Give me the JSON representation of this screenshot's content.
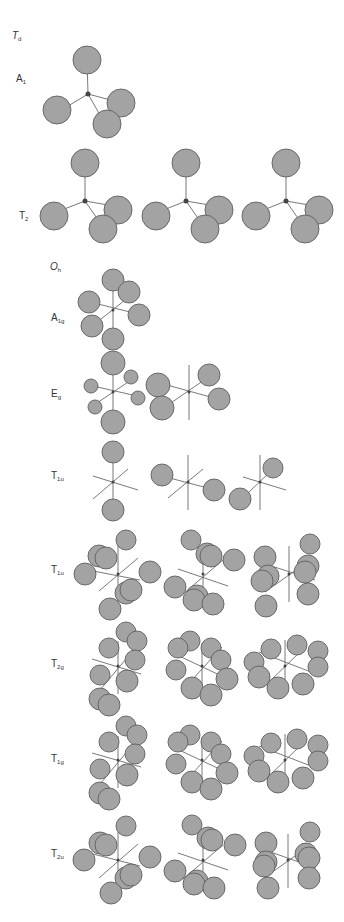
{
  "colors": {
    "lobe_fill": "#a3a3a3",
    "lobe_stroke": "#5f5f5f",
    "bond": "#6a6a6a",
    "center": "#444444",
    "text": "#333333"
  },
  "labels": [
    {
      "id": "group-td",
      "main": "T",
      "sub": "d",
      "italic": true,
      "x": 12,
      "y": 37
    },
    {
      "id": "irrep-a1",
      "main": "A",
      "sub": "1",
      "italic": false,
      "x": 16,
      "y": 80
    },
    {
      "id": "irrep-t2",
      "main": "T",
      "sub": "2",
      "italic": false,
      "x": 19,
      "y": 217
    },
    {
      "id": "group-oh",
      "main": "O",
      "sub": "h",
      "italic": true,
      "x": 50,
      "y": 268
    },
    {
      "id": "irrep-a1g",
      "main": "A",
      "sub": "1g",
      "italic": false,
      "x": 51,
      "y": 319
    },
    {
      "id": "irrep-eg",
      "main": "E",
      "sub": "g",
      "italic": false,
      "x": 51,
      "y": 395
    },
    {
      "id": "irrep-t1u-a",
      "main": "T",
      "sub": "1u",
      "italic": false,
      "x": 51,
      "y": 477
    },
    {
      "id": "irrep-t1u-b",
      "main": "T",
      "sub": "1u",
      "italic": false,
      "x": 51,
      "y": 571
    },
    {
      "id": "irrep-t2g",
      "main": "T",
      "sub": "2g",
      "italic": false,
      "x": 51,
      "y": 665
    },
    {
      "id": "irrep-t1g",
      "main": "T",
      "sub": "1g",
      "italic": false,
      "x": 51,
      "y": 760
    },
    {
      "id": "irrep-t2u",
      "main": "T",
      "sub": "2u",
      "italic": false,
      "x": 51,
      "y": 855
    }
  ],
  "diagrams": [
    {
      "id": "td-a1",
      "center": [
        88,
        94
      ],
      "lines": [
        [
          88,
          94,
          87,
          60
        ],
        [
          88,
          94,
          58,
          112
        ],
        [
          88,
          94,
          118,
          102
        ],
        [
          88,
          94,
          104,
          122
        ]
      ],
      "lobes": [
        [
          87,
          60,
          14
        ],
        [
          57,
          110,
          14
        ],
        [
          121,
          103,
          14
        ],
        [
          107,
          124,
          14
        ]
      ]
    },
    {
      "id": "td-t2-1",
      "center": [
        85,
        201
      ],
      "lines": [
        [
          85,
          201,
          85,
          167
        ],
        [
          85,
          201,
          54,
          213
        ],
        [
          85,
          201,
          114,
          206
        ],
        [
          85,
          201,
          101,
          224
        ]
      ],
      "lobes": [
        [
          85,
          163,
          14
        ],
        [
          54,
          216,
          14
        ],
        [
          118,
          210,
          14
        ],
        [
          103,
          229,
          14
        ]
      ]
    },
    {
      "id": "td-t2-2",
      "center": [
        186,
        201
      ],
      "lines": [
        [
          186,
          201,
          186,
          167
        ],
        [
          186,
          201,
          156,
          213
        ],
        [
          186,
          201,
          215,
          206
        ],
        [
          186,
          201,
          202,
          224
        ]
      ],
      "lobes": [
        [
          186,
          163,
          14
        ],
        [
          156,
          216,
          14
        ],
        [
          219,
          210,
          14
        ],
        [
          205,
          229,
          14
        ]
      ]
    },
    {
      "id": "td-t2-3",
      "center": [
        286,
        201
      ],
      "lines": [
        [
          286,
          201,
          286,
          167
        ],
        [
          286,
          201,
          256,
          213
        ],
        [
          286,
          201,
          315,
          206
        ],
        [
          286,
          201,
          302,
          224
        ]
      ],
      "lobes": [
        [
          286,
          163,
          14
        ],
        [
          256,
          216,
          14
        ],
        [
          319,
          210,
          14
        ],
        [
          305,
          229,
          14
        ]
      ]
    },
    {
      "id": "oh-a1g",
      "center": [
        113,
        310
      ],
      "lines": [
        [
          113,
          290,
          113,
          332
        ],
        [
          90,
          302,
          138,
          314
        ],
        [
          96,
          323,
          134,
          293
        ]
      ],
      "lobes": [
        [
          113,
          280,
          11
        ],
        [
          129,
          292,
          11
        ],
        [
          89,
          302,
          11
        ],
        [
          139,
          315,
          11
        ],
        [
          92,
          326,
          11
        ],
        [
          113,
          339,
          11
        ]
      ]
    },
    {
      "id": "oh-eg-1",
      "center": [
        113,
        392
      ],
      "lines": [
        [
          113,
          372,
          113,
          414
        ],
        [
          93,
          386,
          137,
          396
        ],
        [
          97,
          403,
          131,
          380
        ]
      ],
      "lobes": [
        [
          113,
          363,
          12
        ],
        [
          113,
          422,
          12
        ],
        [
          131,
          377,
          7
        ],
        [
          91,
          386,
          7
        ],
        [
          138,
          398,
          7
        ],
        [
          95,
          407,
          7
        ]
      ]
    },
    {
      "id": "oh-eg-2",
      "center": [
        189,
        392
      ],
      "lines": [
        [
          189,
          365,
          189,
          420
        ],
        [
          167,
          385,
          214,
          398
        ],
        [
          165,
          407,
          210,
          376
        ]
      ],
      "lobes": [
        [
          209,
          375,
          11
        ],
        [
          158,
          385,
          12
        ],
        [
          219,
          399,
          11
        ],
        [
          162,
          408,
          12
        ]
      ]
    },
    {
      "id": "oh-t1u-1",
      "center": [
        113,
        482
      ],
      "lines": [
        [
          113,
          452,
          113,
          512
        ],
        [
          93,
          476,
          138,
          490
        ],
        [
          93,
          499,
          128,
          469
        ]
      ],
      "lobes": [
        [
          113,
          452,
          11
        ],
        [
          113,
          510,
          11
        ]
      ]
    },
    {
      "id": "oh-t1u-2",
      "center": [
        188,
        482
      ],
      "lines": [
        [
          188,
          455,
          188,
          510
        ],
        [
          166,
          477,
          215,
          490
        ],
        [
          168,
          498,
          203,
          469
        ]
      ],
      "lobes": [
        [
          162,
          475,
          11
        ],
        [
          214,
          490,
          11
        ]
      ]
    },
    {
      "id": "oh-t1u-3",
      "center": [
        260,
        482
      ],
      "lines": [
        [
          260,
          455,
          260,
          510
        ],
        [
          243,
          477,
          286,
          490
        ],
        [
          248,
          493,
          273,
          469
        ]
      ],
      "lobes": [
        [
          273,
          468,
          10
        ],
        [
          240,
          499,
          11
        ]
      ]
    },
    {
      "id": "oh-t1u-pair-1",
      "center": [
        118,
        574
      ],
      "lines": [
        [
          118,
          545,
          118,
          603
        ],
        [
          93,
          571,
          140,
          580
        ],
        [
          99,
          591,
          138,
          558
        ]
      ],
      "pairs": [
        [
          [
            127,
            541,
            10
          ],
          [
            103,
            561,
            11
          ],
          [
            98,
            558,
            11
          ]
        ],
        [
          [
            89,
            575,
            11
          ],
          [
            106,
            573,
            0
          ]
        ],
        [
          [
            149,
            572,
            11
          ]
        ],
        [
          [
            131,
            591,
            11
          ],
          [
            125,
            594,
            11
          ]
        ],
        [
          [
            110,
            608,
            11
          ]
        ]
      ],
      "lobes": [
        [
          126,
          540,
          10
        ],
        [
          99,
          556,
          11
        ],
        [
          106,
          558,
          11
        ],
        [
          85,
          574,
          11
        ],
        [
          150,
          572,
          11
        ],
        [
          126,
          593,
          11
        ],
        [
          131,
          590,
          11
        ],
        [
          110,
          609,
          11
        ]
      ]
    },
    {
      "id": "oh-t1u-pair-2",
      "center": [
        203,
        574
      ],
      "lines": [
        [
          203,
          545,
          203,
          603
        ],
        [
          178,
          569,
          228,
          586
        ],
        [
          183,
          594,
          223,
          560
        ]
      ],
      "lobes": [
        [
          191,
          540,
          10
        ],
        [
          207,
          554,
          11
        ],
        [
          211,
          556,
          11
        ],
        [
          234,
          560,
          11
        ],
        [
          175,
          587,
          11
        ],
        [
          197,
          596,
          11
        ],
        [
          194,
          600,
          11
        ],
        [
          213,
          604,
          11
        ]
      ]
    },
    {
      "id": "oh-t1u-pair-3",
      "center": [
        289,
        574
      ],
      "lines": [
        [
          289,
          546,
          289,
          602
        ],
        [
          262,
          563,
          315,
          580
        ],
        [
          265,
          592,
          310,
          560
        ]
      ],
      "lobes": [
        [
          310,
          544,
          10
        ],
        [
          265,
          557,
          11
        ],
        [
          308,
          566,
          11
        ],
        [
          305,
          572,
          11
        ],
        [
          268,
          576,
          11
        ],
        [
          262,
          581,
          11
        ],
        [
          308,
          594,
          11
        ],
        [
          266,
          606,
          11
        ]
      ]
    },
    {
      "id": "oh-t2g-1",
      "center": [
        118,
        666
      ],
      "lines": [
        [
          118,
          641,
          118,
          694
        ],
        [
          92,
          659,
          141,
          674
        ],
        [
          100,
          690,
          136,
          647
        ]
      ],
      "lobes": [
        [
          126,
          632,
          10
        ],
        [
          137,
          641,
          10
        ],
        [
          109,
          648,
          10
        ],
        [
          135,
          660,
          10
        ],
        [
          100,
          675,
          10
        ],
        [
          127,
          681,
          11
        ],
        [
          100,
          699,
          11
        ],
        [
          109,
          705,
          11
        ]
      ]
    },
    {
      "id": "oh-t2g-2",
      "center": [
        202,
        666
      ],
      "lines": [
        [
          202,
          643,
          202,
          694
        ],
        [
          177,
          655,
          228,
          679
        ],
        [
          182,
          691,
          222,
          647
        ]
      ],
      "lobes": [
        [
          190,
          641,
          10
        ],
        [
          211,
          648,
          10
        ],
        [
          178,
          648,
          10
        ],
        [
          221,
          660,
          10
        ],
        [
          176,
          670,
          10
        ],
        [
          227,
          679,
          11
        ],
        [
          192,
          688,
          11
        ],
        [
          211,
          695,
          11
        ]
      ]
    },
    {
      "id": "oh-t2g-3",
      "center": [
        285,
        666
      ],
      "lines": [
        [
          285,
          640,
          285,
          693
        ],
        [
          259,
          652,
          311,
          672
        ],
        [
          264,
          687,
          305,
          647
        ]
      ],
      "lobes": [
        [
          271,
          649,
          10
        ],
        [
          297,
          645,
          10
        ],
        [
          318,
          651,
          10
        ],
        [
          318,
          667,
          10
        ],
        [
          254,
          662,
          10
        ],
        [
          259,
          677,
          11
        ],
        [
          278,
          688,
          11
        ],
        [
          303,
          684,
          11
        ]
      ]
    },
    {
      "id": "oh-t1g-1",
      "center": [
        118,
        760
      ],
      "lines": [
        [
          118,
          736,
          118,
          788
        ],
        [
          92,
          753,
          141,
          767
        ],
        [
          100,
          784,
          136,
          741
        ]
      ],
      "lobes": [
        [
          126,
          726,
          10
        ],
        [
          137,
          735,
          10
        ],
        [
          109,
          742,
          10
        ],
        [
          135,
          754,
          10
        ],
        [
          100,
          769,
          10
        ],
        [
          127,
          775,
          11
        ],
        [
          100,
          793,
          11
        ],
        [
          109,
          799,
          11
        ]
      ]
    },
    {
      "id": "oh-t1g-2",
      "center": [
        202,
        760
      ],
      "lines": [
        [
          202,
          737,
          202,
          788
        ],
        [
          177,
          749,
          228,
          773
        ],
        [
          182,
          785,
          222,
          741
        ]
      ],
      "lobes": [
        [
          190,
          735,
          10
        ],
        [
          211,
          742,
          10
        ],
        [
          178,
          742,
          10
        ],
        [
          221,
          754,
          10
        ],
        [
          176,
          764,
          10
        ],
        [
          227,
          773,
          11
        ],
        [
          192,
          782,
          11
        ],
        [
          211,
          789,
          11
        ]
      ]
    },
    {
      "id": "oh-t1g-3",
      "center": [
        285,
        760
      ],
      "lines": [
        [
          285,
          734,
          285,
          787
        ],
        [
          259,
          746,
          311,
          766
        ],
        [
          264,
          781,
          305,
          741
        ]
      ],
      "lobes": [
        [
          271,
          743,
          10
        ],
        [
          297,
          739,
          10
        ],
        [
          318,
          745,
          10
        ],
        [
          318,
          761,
          10
        ],
        [
          254,
          756,
          10
        ],
        [
          259,
          771,
          11
        ],
        [
          278,
          782,
          11
        ],
        [
          303,
          778,
          11
        ]
      ]
    },
    {
      "id": "oh-t2u-1",
      "center": [
        118,
        860
      ],
      "lines": [
        [
          118,
          832,
          118,
          890
        ],
        [
          93,
          854,
          140,
          866
        ],
        [
          99,
          878,
          138,
          844
        ]
      ],
      "lobes": [
        [
          126,
          826,
          10
        ],
        [
          100,
          843,
          11
        ],
        [
          106,
          845,
          11
        ],
        [
          84,
          860,
          11
        ],
        [
          150,
          857,
          11
        ],
        [
          126,
          878,
          11
        ],
        [
          131,
          875,
          11
        ],
        [
          111,
          893,
          11
        ]
      ]
    },
    {
      "id": "oh-t2u-2",
      "center": [
        203,
        860
      ],
      "lines": [
        [
          203,
          832,
          203,
          890
        ],
        [
          178,
          853,
          228,
          870
        ],
        [
          183,
          879,
          223,
          845
        ]
      ],
      "lobes": [
        [
          192,
          825,
          10
        ],
        [
          208,
          838,
          11
        ],
        [
          212,
          840,
          11
        ],
        [
          235,
          845,
          11
        ],
        [
          175,
          871,
          11
        ],
        [
          197,
          881,
          11
        ],
        [
          194,
          884,
          11
        ],
        [
          214,
          888,
          11
        ]
      ]
    },
    {
      "id": "oh-t2u-3",
      "center": [
        288,
        860
      ],
      "lines": [
        [
          288,
          834,
          288,
          888
        ],
        [
          262,
          849,
          316,
          868
        ],
        [
          264,
          878,
          309,
          846
        ]
      ],
      "lobes": [
        [
          310,
          832,
          10
        ],
        [
          266,
          843,
          11
        ],
        [
          306,
          854,
          11
        ],
        [
          309,
          858,
          11
        ],
        [
          266,
          862,
          11
        ],
        [
          264,
          866,
          11
        ],
        [
          309,
          878,
          11
        ],
        [
          268,
          888,
          11
        ]
      ]
    }
  ]
}
